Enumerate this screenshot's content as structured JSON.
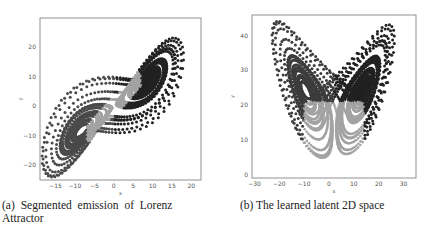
{
  "figure": {
    "panels": [
      {
        "id": "a",
        "caption": "(a) Segmented emission of Lorenz Attractor",
        "caption_line1": "(a) Segmented emission of Lorenz",
        "caption_line2": "Attractor"
      },
      {
        "id": "b",
        "caption": "(b) The learned latent 2D space"
      }
    ]
  },
  "chart_data": [
    {
      "type": "scatter",
      "title": "",
      "xlabel": "x",
      "ylabel": "y",
      "xlim": [
        -19,
        22.5
      ],
      "ylim": [
        -25,
        30
      ],
      "xticks": [
        -15,
        -10,
        -5,
        0,
        5,
        10,
        15,
        20
      ],
      "yticks": [
        -20,
        -10,
        0,
        10,
        20
      ],
      "grid": false,
      "legend": null,
      "description": "Lorenz attractor trajectory projected on x-y plane, points colored by segment (3 segments)",
      "series": [
        {
          "name": "segment-left-lobe",
          "color": "#4a4a4a"
        },
        {
          "name": "segment-right-lobe",
          "color": "#222222"
        },
        {
          "name": "segment-transition",
          "color": "#a3a3a3"
        }
      ]
    },
    {
      "type": "scatter",
      "title": "",
      "xlabel": "x",
      "ylabel": "y",
      "xlim": [
        -31,
        35
      ],
      "ylim": [
        -1,
        46
      ],
      "xticks": [
        -30,
        -20,
        -10,
        0,
        10,
        20,
        30
      ],
      "yticks": [
        0,
        10,
        20,
        30,
        40
      ],
      "grid": false,
      "legend": null,
      "description": "Learned latent 2D space of the Lorenz trajectory (butterfly shape), points colored by segment",
      "series": [
        {
          "name": "segment-left-lobe",
          "color": "#3c3c3c"
        },
        {
          "name": "segment-right-lobe",
          "color": "#222222"
        },
        {
          "name": "segment-transition",
          "color": "#a3a3a3"
        }
      ]
    }
  ],
  "layout": {
    "panels": [
      {
        "frame": {
          "x0": 40,
          "y0": 18,
          "x1": 201,
          "y1": 180
        }
      },
      {
        "frame": {
          "x0": 252,
          "y0": 15,
          "x1": 416,
          "y1": 178
        }
      }
    ]
  }
}
